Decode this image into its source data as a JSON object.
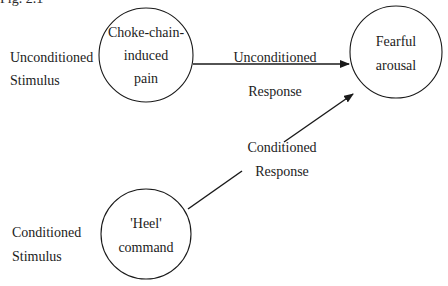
{
  "figure": {
    "caption_fragment": "Fig. 2.1",
    "nodes": {
      "ucs_circle": {
        "lines": [
          "Choke-chain-",
          "induced",
          "pain"
        ]
      },
      "response_circle": {
        "lines": [
          "Fearful",
          "arousal"
        ]
      },
      "cs_circle": {
        "lines": [
          "'Heel'",
          "command"
        ]
      }
    },
    "side_labels": {
      "unconditioned_stimulus": [
        "Unconditioned",
        "Stimulus"
      ],
      "conditioned_stimulus": [
        "Conditioned",
        "Stimulus"
      ]
    },
    "edges": {
      "unconditioned_response": {
        "label": [
          "Unconditioned",
          "Response"
        ],
        "from": "ucs_circle",
        "to": "response_circle"
      },
      "conditioned_response": {
        "label": [
          "Conditioned",
          "Response"
        ],
        "from": "cs_circle",
        "to": "response_circle"
      }
    },
    "colors": {
      "stroke": "#1a1a1a",
      "background": "#ffffff"
    }
  }
}
